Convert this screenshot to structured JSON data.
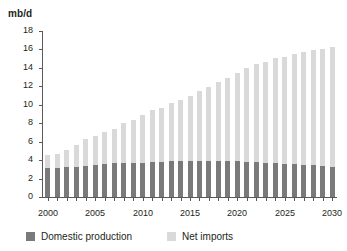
{
  "chart_data": {
    "type": "bar",
    "stacked": true,
    "title": "",
    "subtitle": "",
    "xlabel": "",
    "ylabel": "mb/d",
    "ylim": [
      0,
      18
    ],
    "ytick_labels": [
      "0",
      "2",
      "4",
      "6",
      "8",
      "10",
      "12",
      "14",
      "16",
      "18"
    ],
    "yticks": [
      0,
      2,
      4,
      6,
      8,
      10,
      12,
      14,
      16,
      18
    ],
    "grid": false,
    "legend_position": "bottom",
    "categories": [
      "2000",
      "2001",
      "2002",
      "2003",
      "2004",
      "2005",
      "2006",
      "2007",
      "2008",
      "2009",
      "2010",
      "2011",
      "2012",
      "2013",
      "2014",
      "2015",
      "2016",
      "2017",
      "2018",
      "2019",
      "2020",
      "2021",
      "2022",
      "2023",
      "2024",
      "2025",
      "2026",
      "2027",
      "2028",
      "2029",
      "2030"
    ],
    "xtick_labels": [
      "2000",
      "2005",
      "2010",
      "2015",
      "2020",
      "2025",
      "2030"
    ],
    "xticks": [
      2000,
      2005,
      2010,
      2015,
      2020,
      2025,
      2030
    ],
    "series": [
      {
        "name": "Domestic production",
        "color": "#7a7a7a",
        "values": [
          3.1,
          3.2,
          3.3,
          3.3,
          3.4,
          3.5,
          3.6,
          3.7,
          3.7,
          3.7,
          3.7,
          3.8,
          3.8,
          3.9,
          3.9,
          3.9,
          3.9,
          3.9,
          3.9,
          3.9,
          3.9,
          3.8,
          3.8,
          3.7,
          3.7,
          3.6,
          3.6,
          3.5,
          3.5,
          3.4,
          3.3
        ]
      },
      {
        "name": "Net imports",
        "color": "#d9d9d9",
        "values": [
          1.5,
          1.5,
          1.8,
          2.3,
          2.9,
          3.1,
          3.4,
          3.7,
          4.3,
          4.6,
          5.2,
          5.6,
          5.9,
          6.3,
          6.6,
          7.1,
          7.6,
          8.0,
          8.6,
          9.0,
          9.6,
          10.2,
          10.6,
          10.9,
          11.4,
          11.6,
          11.9,
          12.2,
          12.4,
          12.7,
          13.0
        ]
      }
    ],
    "totals": [
      4.6,
      4.7,
      5.1,
      5.6,
      6.3,
      6.6,
      7.0,
      7.4,
      8.0,
      8.3,
      8.9,
      9.4,
      9.7,
      10.2,
      10.5,
      11.0,
      11.5,
      11.9,
      12.5,
      12.9,
      13.5,
      14.0,
      14.4,
      14.6,
      15.1,
      15.2,
      15.5,
      15.7,
      15.9,
      16.1,
      16.3
    ]
  },
  "legend": {
    "items": [
      {
        "label": "Domestic production",
        "color": "#7a7a7a"
      },
      {
        "label": "Net imports",
        "color": "#d9d9d9"
      }
    ]
  }
}
